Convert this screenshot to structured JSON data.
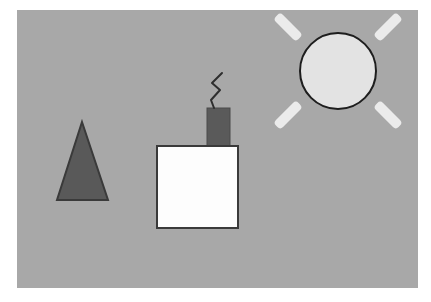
{
  "scene": {
    "title": "Child's crayon drawing of a house with sun and tree",
    "canvas": {
      "width": 401,
      "height": 278,
      "offset_x": 17,
      "offset_y": 10,
      "background_color": "#a8a8a8",
      "page_color": "#ffffff"
    },
    "palette": {
      "background_gray": "#a8a8a8",
      "page_white": "#ffffff",
      "outline_dark": "#3a3a3a",
      "triangle_fill": "#595959",
      "chimney_fill": "#5a5a5a",
      "house_fill": "#fdfdfd",
      "sun_fill": "#e3e3e3",
      "sun_ray_fill": "#ebebeb",
      "smoke_stroke": "#2e2e2e"
    },
    "objects": [
      {
        "name": "tree-triangle",
        "type": "triangle",
        "label": "Tree",
        "fill": "#595959",
        "stroke": "#3a3a3a",
        "stroke_width": 2,
        "points": "65,112 91,190 40,190",
        "apex_x": 65,
        "apex_y": 112,
        "base_left_x": 40,
        "base_right_x": 91,
        "base_y": 190
      },
      {
        "name": "house-body-square",
        "type": "rectangle",
        "label": "House",
        "fill": "#fdfdfd",
        "stroke": "#3a3a3a",
        "stroke_width": 2,
        "x": 140,
        "y": 136,
        "width": 81,
        "height": 82
      },
      {
        "name": "chimney-rectangle",
        "type": "rectangle",
        "label": "Chimney",
        "fill": "#5a5a5a",
        "stroke": "#4a4a4a",
        "stroke_width": 1,
        "x": 190,
        "y": 98,
        "width": 23,
        "height": 42
      },
      {
        "name": "smoke-zigzag",
        "type": "polyline",
        "label": "Smoke",
        "fill": "none",
        "stroke": "#2e2e2e",
        "stroke_width": 2,
        "points": "205,63 195,73 203,80 194,90 197,98"
      },
      {
        "name": "sun-circle",
        "type": "circle",
        "label": "Sun",
        "fill": "#e3e3e3",
        "stroke": "#1e1e1e",
        "stroke_width": 2,
        "center_x": 321,
        "center_y": 61,
        "radius": 38
      },
      {
        "name": "sun-rays",
        "type": "ray-group",
        "label": "Sun rays",
        "fill": "#ebebeb",
        "count": 4,
        "ray_length": 32,
        "ray_thickness": 10,
        "rays": [
          {
            "name": "sun-ray-top-left",
            "angle_deg": 225,
            "x": 255,
            "y": 12,
            "w": 32,
            "h": 10,
            "rotate": 45
          },
          {
            "name": "sun-ray-top-right",
            "angle_deg": 315,
            "x": 355,
            "y": 12,
            "w": 32,
            "h": 10,
            "rotate": -45
          },
          {
            "name": "sun-ray-bottom-left",
            "angle_deg": 135,
            "x": 255,
            "y": 100,
            "w": 32,
            "h": 10,
            "rotate": -45
          },
          {
            "name": "sun-ray-bottom-right",
            "angle_deg": 45,
            "x": 355,
            "y": 100,
            "w": 32,
            "h": 10,
            "rotate": 45
          }
        ]
      }
    ]
  }
}
